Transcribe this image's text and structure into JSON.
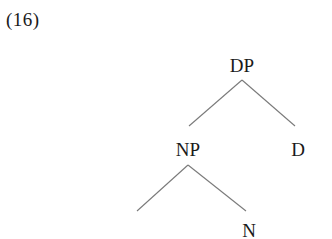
{
  "example": {
    "number": "(16)"
  },
  "tree": {
    "line_color": "#7a7a7a",
    "text_color": "#1a1a1a",
    "nodes": [
      {
        "id": "DP",
        "label": "DP",
        "x": 242,
        "y": 56
      },
      {
        "id": "NP",
        "label": "NP",
        "x": 188,
        "y": 140
      },
      {
        "id": "D",
        "label": "D",
        "x": 298,
        "y": 140
      },
      {
        "id": "N",
        "label": "N",
        "x": 249,
        "y": 221
      }
    ],
    "edges": [
      {
        "from": "DP",
        "to": "NP",
        "x1": 242,
        "y1": 80,
        "x2": 189,
        "y2": 126
      },
      {
        "from": "DP",
        "to": "D",
        "x1": 242,
        "y1": 80,
        "x2": 295,
        "y2": 126
      },
      {
        "from": "NP",
        "to": "empty",
        "x1": 188,
        "y1": 165,
        "x2": 137,
        "y2": 211
      },
      {
        "from": "NP",
        "to": "N",
        "x1": 188,
        "y1": 165,
        "x2": 246,
        "y2": 211
      }
    ]
  }
}
